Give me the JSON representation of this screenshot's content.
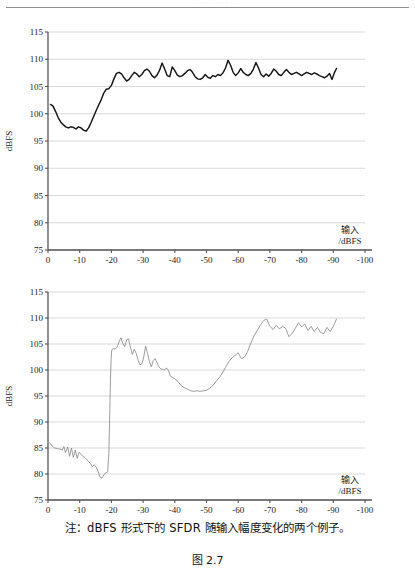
{
  "header": {
    "running_text": "· · · · · · · ·"
  },
  "caption": {
    "note": "注：dBFS 形式下的 SFDR 随输入幅度变化的两个例子。",
    "figure_number": "图 2.7"
  },
  "colors": {
    "top_curve": "#151515",
    "bottom_curve": "#8a8a8a",
    "grid": "#c9c9c9",
    "axis": "#555555",
    "text": "#1a1a1a"
  },
  "chart_data": [
    {
      "id": "top",
      "type": "line",
      "title": "",
      "xlabel": "输入\n/dBFS",
      "xlabel_lines": [
        "输入",
        "/dBFS"
      ],
      "ylabel": "dBFS",
      "xlim": [
        0,
        -100
      ],
      "ylim": [
        75,
        115
      ],
      "xticks": [
        0,
        -10,
        -20,
        -30,
        -40,
        -50,
        -60,
        -70,
        -80,
        -90,
        -100
      ],
      "xtick_labels": [
        "0",
        "-10",
        "-20",
        "-30",
        "-40",
        "-50",
        "-60",
        "-70",
        "-80",
        "-90",
        "-100"
      ],
      "yticks": [
        75,
        80,
        85,
        90,
        95,
        100,
        105,
        110,
        115
      ],
      "ytick_labels": [
        "75",
        "80",
        "85",
        "90",
        "95",
        "100",
        "105",
        "110",
        "115"
      ],
      "grid": true,
      "legend": false,
      "data_xmax": -91,
      "series": [
        {
          "name": "SFDR dBFS example 1",
          "x": [
            -0.8,
            -1.6,
            -2.4,
            -3.2,
            -4.0,
            -4.8,
            -5.6,
            -6.4,
            -7.2,
            -8.0,
            -8.8,
            -9.6,
            -10.4,
            -11.2,
            -12.0,
            -12.8,
            -13.6,
            -14.4,
            -15.2,
            -16.0,
            -16.8,
            -17.6,
            -18.4,
            -19.2,
            -20.0,
            -20.8,
            -21.6,
            -22.4,
            -23.2,
            -24.0,
            -24.8,
            -25.6,
            -26.4,
            -27.2,
            -28.0,
            -28.8,
            -29.6,
            -30.4,
            -31.2,
            -32.0,
            -32.8,
            -33.6,
            -34.4,
            -35.2,
            -36.0,
            -36.8,
            -37.6,
            -38.4,
            -39.2,
            -40.0,
            -40.8,
            -41.6,
            -42.4,
            -43.2,
            -44.0,
            -44.8,
            -45.6,
            -46.4,
            -47.2,
            -48.0,
            -48.8,
            -49.6,
            -50.4,
            -51.2,
            -52.0,
            -52.8,
            -53.6,
            -54.4,
            -55.2,
            -56.0,
            -56.8,
            -57.6,
            -58.4,
            -59.2,
            -60.0,
            -60.8,
            -61.6,
            -62.4,
            -63.2,
            -64.0,
            -64.8,
            -65.6,
            -66.4,
            -67.2,
            -68.0,
            -68.8,
            -69.6,
            -70.4,
            -71.2,
            -72.0,
            -72.8,
            -73.6,
            -74.4,
            -75.2,
            -76.0,
            -76.8,
            -77.6,
            -78.4,
            -79.2,
            -80.0,
            -80.8,
            -81.6,
            -82.4,
            -83.2,
            -84.0,
            -84.8,
            -85.6,
            -86.4,
            -87.2,
            -88.0,
            -88.8,
            -89.6,
            -90.4,
            -91.0
          ],
          "y": [
            101.7,
            101.4,
            100.4,
            99.3,
            98.5,
            98.0,
            97.6,
            97.4,
            97.6,
            97.5,
            97.2,
            97.6,
            97.4,
            97.0,
            96.8,
            97.4,
            98.4,
            99.5,
            100.6,
            101.6,
            102.6,
            103.8,
            104.5,
            104.6,
            105.2,
            106.4,
            107.4,
            107.6,
            107.3,
            106.6,
            106.0,
            106.3,
            107.0,
            107.6,
            107.3,
            106.8,
            107.2,
            107.9,
            108.2,
            107.8,
            107.0,
            106.6,
            107.1,
            108.0,
            109.3,
            108.2,
            107.0,
            106.8,
            108.6,
            107.9,
            107.1,
            106.8,
            107.0,
            107.4,
            107.9,
            108.1,
            107.6,
            106.8,
            106.4,
            106.3,
            106.6,
            107.2,
            106.7,
            106.5,
            107.0,
            106.8,
            107.2,
            107.0,
            107.5,
            108.4,
            109.8,
            108.9,
            107.6,
            107.0,
            107.5,
            108.3,
            107.6,
            107.2,
            107.0,
            107.4,
            108.2,
            109.4,
            108.4,
            107.2,
            106.8,
            107.3,
            106.9,
            107.4,
            108.2,
            107.8,
            107.2,
            107.0,
            107.6,
            108.1,
            107.6,
            107.2,
            107.4,
            107.6,
            107.3,
            107.0,
            107.3,
            107.6,
            107.4,
            107.2,
            107.5,
            107.3,
            107.0,
            106.8,
            106.6,
            106.9,
            107.4,
            106.3,
            107.6,
            108.3
          ]
        }
      ]
    },
    {
      "id": "bottom",
      "type": "line",
      "title": "",
      "xlabel": "输入\n/dBFS",
      "xlabel_lines": [
        "输入",
        "/dBFS"
      ],
      "ylabel": "dBFS",
      "xlim": [
        0,
        -100
      ],
      "ylim": [
        75,
        115
      ],
      "xticks": [
        0,
        -10,
        -20,
        -30,
        -40,
        -50,
        -60,
        -70,
        -80,
        -90,
        -100
      ],
      "xtick_labels": [
        "0",
        "-10",
        "-20",
        "-30",
        "-40",
        "-50",
        "-60",
        "-70",
        "-80",
        "-90",
        "-100"
      ],
      "yticks": [
        75,
        80,
        85,
        90,
        95,
        100,
        105,
        110,
        115
      ],
      "ytick_labels": [
        "75",
        "80",
        "85",
        "90",
        "95",
        "100",
        "105",
        "110",
        "115"
      ],
      "grid": true,
      "legend": false,
      "data_xmax": -91,
      "series": [
        {
          "name": "SFDR dBFS example 2",
          "x": [
            -0.5,
            -1.3,
            -2.1,
            -2.9,
            -3.7,
            -4.5,
            -5.0,
            -5.5,
            -6.2,
            -6.8,
            -7.4,
            -8.0,
            -8.6,
            -9.2,
            -9.8,
            -10.4,
            -11.0,
            -11.6,
            -12.2,
            -12.8,
            -13.4,
            -14.0,
            -14.6,
            -15.2,
            -15.8,
            -16.4,
            -17.0,
            -17.6,
            -18.2,
            -18.8,
            -19.2,
            -19.5,
            -19.7,
            -19.9,
            -20.1,
            -20.6,
            -21.2,
            -21.8,
            -22.4,
            -23.0,
            -23.6,
            -24.2,
            -24.8,
            -25.4,
            -26.0,
            -26.6,
            -27.2,
            -27.8,
            -28.4,
            -29.0,
            -29.6,
            -30.2,
            -30.8,
            -31.4,
            -32.0,
            -32.6,
            -33.2,
            -33.8,
            -34.4,
            -35.0,
            -35.6,
            -36.2,
            -36.8,
            -37.4,
            -38.0,
            -38.6,
            -39.2,
            -40.0,
            -41.0,
            -42.0,
            -43.0,
            -44.0,
            -45.0,
            -46.0,
            -47.0,
            -48.0,
            -49.0,
            -50.0,
            -51.0,
            -52.0,
            -53.0,
            -54.0,
            -55.0,
            -56.0,
            -57.0,
            -58.0,
            -59.0,
            -60.0,
            -61.0,
            -62.0,
            -63.0,
            -64.0,
            -65.0,
            -66.0,
            -67.0,
            -68.0,
            -69.0,
            -70.0,
            -71.0,
            -72.0,
            -73.0,
            -74.0,
            -75.0,
            -76.0,
            -77.0,
            -78.0,
            -79.0,
            -80.0,
            -81.0,
            -82.0,
            -83.0,
            -84.0,
            -85.0,
            -86.0,
            -87.0,
            -88.0,
            -89.0,
            -90.0,
            -90.6,
            -91.0
          ],
          "y": [
            86.0,
            85.4,
            85.0,
            84.9,
            84.8,
            84.6,
            85.3,
            84.1,
            85.2,
            83.4,
            85.0,
            83.2,
            84.6,
            83.0,
            84.2,
            83.8,
            83.4,
            83.2,
            82.8,
            82.4,
            82.0,
            81.4,
            81.8,
            81.3,
            80.5,
            79.4,
            79.2,
            79.8,
            80.2,
            80.4,
            84.0,
            92.0,
            98.0,
            102.0,
            103.8,
            104.2,
            104.0,
            104.4,
            105.4,
            106.2,
            105.1,
            104.5,
            105.8,
            106.0,
            104.4,
            103.0,
            104.0,
            103.2,
            102.0,
            101.0,
            101.2,
            102.5,
            104.6,
            103.2,
            101.6,
            100.6,
            101.8,
            102.2,
            101.4,
            100.6,
            100.2,
            100.1,
            100.0,
            100.4,
            99.9,
            98.8,
            98.6,
            98.3,
            97.8,
            97.0,
            96.6,
            96.3,
            96.0,
            95.9,
            96.0,
            95.9,
            96.0,
            96.1,
            96.5,
            97.0,
            97.8,
            98.5,
            99.4,
            100.5,
            101.6,
            102.3,
            102.8,
            103.3,
            102.2,
            102.5,
            103.6,
            105.2,
            106.6,
            107.6,
            108.6,
            109.5,
            109.8,
            108.4,
            107.8,
            108.6,
            107.9,
            108.4,
            108.0,
            106.4,
            107.0,
            108.0,
            109.1,
            108.3,
            108.8,
            107.6,
            108.4,
            107.4,
            108.2,
            107.2,
            107.0,
            108.2,
            107.4,
            108.4,
            109.2,
            109.8
          ]
        }
      ]
    }
  ]
}
